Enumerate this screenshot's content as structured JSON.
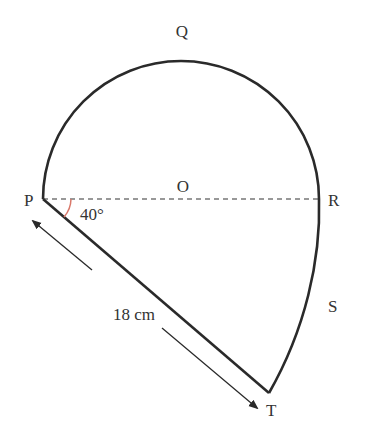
{
  "diagram": {
    "points": {
      "P": "P",
      "Q": "Q",
      "R": "R",
      "S": "S",
      "T": "T",
      "O": "O"
    },
    "angle_label": "40°",
    "length_label": "18 cm",
    "colors": {
      "stroke": "#2a2a2a",
      "angle_arc": "#d9786a",
      "text": "#333333"
    }
  }
}
